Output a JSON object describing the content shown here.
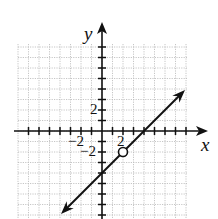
{
  "chart_data": {
    "type": "line",
    "title": "",
    "xlabel": "x",
    "ylabel": "y",
    "xlim": [
      -8,
      8
    ],
    "ylim": [
      -8,
      8
    ],
    "grid": true,
    "tick_labels": {
      "x": [
        "-2",
        "2"
      ],
      "y": [
        "2",
        "-2"
      ]
    },
    "series": [
      {
        "name": "y = x - 4",
        "equation": "y = x - 4",
        "slope": 1,
        "intercept": -4,
        "x": [
          -4,
          8
        ],
        "y": [
          -8,
          4
        ],
        "arrows_both_ends": true
      }
    ],
    "annotations": [
      {
        "type": "open-circle",
        "x": 2,
        "y": -2
      }
    ]
  },
  "labels": {
    "x_axis": "x",
    "y_axis": "y",
    "x_neg2": "−2",
    "x_pos2": "2",
    "y_pos2": "2",
    "y_neg2": "−2"
  },
  "colors": {
    "grid": "#b8b8b8",
    "axis": "#111111",
    "line": "#111111"
  }
}
